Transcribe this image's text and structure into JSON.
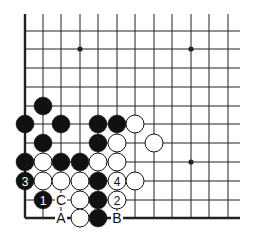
{
  "diagram": {
    "type": "go-board-fragment",
    "columns_x": [
      25,
      43,
      61,
      80,
      98,
      117,
      135,
      154,
      172,
      191,
      209,
      228
    ],
    "rows_y": [
      31,
      49,
      68,
      87,
      106,
      124,
      143,
      162,
      181,
      200,
      218
    ],
    "line_top": 14,
    "line_right": 240,
    "edges": [
      "left",
      "bottom"
    ],
    "colors": {
      "black": "#111111",
      "white": "#ffffff",
      "line": "#222222"
    },
    "star_points": [
      [
        3,
        1
      ],
      [
        9,
        1
      ],
      [
        9,
        7
      ]
    ],
    "stones": [
      {
        "c": 1,
        "r": 4,
        "color": "black"
      },
      {
        "c": 0,
        "r": 5,
        "color": "black"
      },
      {
        "c": 2,
        "r": 5,
        "color": "black"
      },
      {
        "c": 4,
        "r": 5,
        "color": "black"
      },
      {
        "c": 5,
        "r": 5,
        "color": "black"
      },
      {
        "c": 6,
        "r": 5,
        "color": "white"
      },
      {
        "c": 1,
        "r": 6,
        "color": "black"
      },
      {
        "c": 4,
        "r": 6,
        "color": "black"
      },
      {
        "c": 5,
        "r": 6,
        "color": "white"
      },
      {
        "c": 7,
        "r": 6,
        "color": "white"
      },
      {
        "c": 0,
        "r": 7,
        "color": "black"
      },
      {
        "c": 1,
        "r": 7,
        "color": "white"
      },
      {
        "c": 2,
        "r": 7,
        "color": "black"
      },
      {
        "c": 3,
        "r": 7,
        "color": "black"
      },
      {
        "c": 4,
        "r": 7,
        "color": "white"
      },
      {
        "c": 5,
        "r": 7,
        "color": "white"
      },
      {
        "c": 0,
        "r": 8,
        "color": "black",
        "label": "3"
      },
      {
        "c": 1,
        "r": 8,
        "color": "white"
      },
      {
        "c": 2,
        "r": 8,
        "color": "white"
      },
      {
        "c": 3,
        "r": 8,
        "color": "white"
      },
      {
        "c": 4,
        "r": 8,
        "color": "black"
      },
      {
        "c": 5,
        "r": 8,
        "color": "white",
        "label": "4"
      },
      {
        "c": 6,
        "r": 8,
        "color": "white"
      },
      {
        "c": 1,
        "r": 9,
        "color": "black",
        "label": "1"
      },
      {
        "c": 3,
        "r": 9,
        "color": "white"
      },
      {
        "c": 4,
        "r": 9,
        "color": "black"
      },
      {
        "c": 5,
        "r": 9,
        "color": "white",
        "label": "2"
      },
      {
        "c": 3,
        "r": 10,
        "color": "white"
      },
      {
        "c": 4,
        "r": 10,
        "color": "black"
      }
    ],
    "letters": [
      {
        "c": 2,
        "r": 9,
        "text": "C"
      },
      {
        "c": 2,
        "r": 10,
        "text": "A"
      },
      {
        "c": 5,
        "r": 10,
        "text": "B"
      }
    ]
  }
}
